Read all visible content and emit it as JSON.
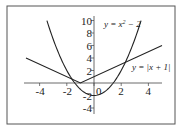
{
  "chart_data": {
    "type": "line",
    "title": "",
    "xlabel": "",
    "ylabel": "",
    "xlim": [
      -5,
      5
    ],
    "ylim": [
      -5,
      10
    ],
    "x_ticks": [
      "-4",
      "-2",
      "0",
      "2",
      "4"
    ],
    "y_ticks": [
      "10",
      "8",
      "6",
      "4",
      "2",
      "-2",
      "-4"
    ],
    "grid": false,
    "series": [
      {
        "name": "y = x^2 - 2",
        "label": "y = x² − 2",
        "x": [
          -3.46,
          -3,
          -2,
          -1,
          0,
          1,
          2,
          3,
          3.46
        ],
        "y": [
          10,
          7,
          2,
          -1,
          -2,
          -1,
          2,
          7,
          10
        ]
      },
      {
        "name": "y = |x + 1|",
        "label": "y = |x + 1|",
        "x": [
          -5,
          -1,
          5
        ],
        "y": [
          4,
          0,
          6
        ]
      }
    ],
    "annotations": [
      "y = x² − 2",
      "y = |x + 1|"
    ]
  }
}
